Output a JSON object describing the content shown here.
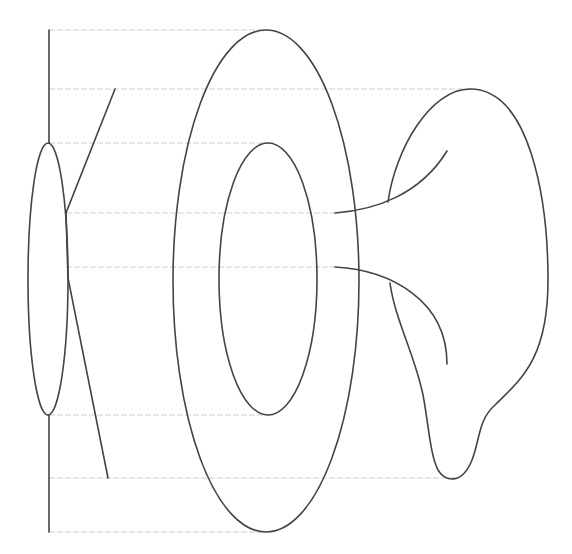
{
  "diagram": {
    "colors": {
      "background": "#ffffff",
      "stroke": "#444444",
      "guide": "#cfcfcf"
    },
    "guide_lines_y": [
      30,
      89,
      143,
      213,
      267,
      415,
      478,
      532
    ],
    "elements": [
      {
        "name": "vertical-axis",
        "type": "line"
      },
      {
        "name": "small-ellipse",
        "type": "ellipse"
      },
      {
        "name": "diagonal-lines",
        "type": "polyline"
      },
      {
        "name": "outer-ellipse",
        "type": "ellipse"
      },
      {
        "name": "inner-ellipse",
        "type": "ellipse"
      },
      {
        "name": "funnel-pinna",
        "type": "path"
      }
    ]
  }
}
